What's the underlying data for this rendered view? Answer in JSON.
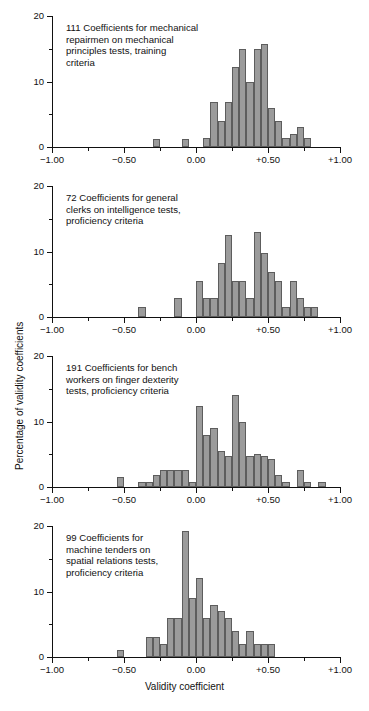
{
  "figure": {
    "axis_label_y": "Percentage of validity coefficients",
    "axis_label_x": "Validity coefficient",
    "x_ticks": [
      "−1.00",
      "−0.50",
      "0.00",
      "+0.50",
      "+1.00"
    ],
    "x_tick_values": [
      -1.0,
      -0.5,
      0.0,
      0.5,
      1.0
    ],
    "y_ticks": [
      "0",
      "10",
      "20"
    ],
    "y_tick_values": [
      0,
      10,
      20
    ],
    "bar_color": "#9b9b9b",
    "bar_edge_color": "#5d5d5d",
    "axis_color": "#111111"
  },
  "chart_data": [
    {
      "type": "bar",
      "title": "111 Coefficients for mechanical repairmen on mechanical principles tests, training criteria",
      "caption_lines": "111 Coefficients for mechanical\nrepairmen on mechanical\nprinciples tests, training\ncriteria",
      "n": 111,
      "xlabel": "Validity coefficient",
      "ylabel": "Percentage of validity coefficients",
      "xlim": [
        -1.0,
        1.0
      ],
      "ylim": [
        0,
        20
      ],
      "bin_width": 0.05,
      "grid": false,
      "bins": [
        -0.3,
        -0.1,
        0.05,
        0.1,
        0.15,
        0.2,
        0.25,
        0.3,
        0.35,
        0.4,
        0.45,
        0.5,
        0.55,
        0.6,
        0.65,
        0.7,
        0.75
      ],
      "values": [
        1.2,
        1.2,
        1.3,
        6.8,
        4.0,
        6.8,
        12.2,
        15.0,
        10.0,
        15.0,
        15.8,
        6.0,
        4.0,
        1.3,
        2.0,
        3.0,
        1.3
      ]
    },
    {
      "type": "bar",
      "title": "72 Coefficients for general clerks on intelligence tests, proficiency criteria",
      "caption_lines": "72 Coefficients for general\nclerks on intelligence tests,\nproficiency criteria",
      "n": 72,
      "xlabel": "Validity coefficient",
      "ylabel": "Percentage of validity coefficients",
      "xlim": [
        -1.0,
        1.0
      ],
      "ylim": [
        0,
        20
      ],
      "bin_width": 0.05,
      "grid": false,
      "bins": [
        -0.4,
        -0.15,
        0.0,
        0.05,
        0.1,
        0.15,
        0.2,
        0.25,
        0.3,
        0.35,
        0.4,
        0.45,
        0.5,
        0.55,
        0.6,
        0.65,
        0.7,
        0.75,
        0.8
      ],
      "values": [
        1.6,
        2.9,
        5.5,
        2.9,
        2.9,
        8.3,
        12.5,
        5.5,
        5.5,
        2.9,
        13.0,
        9.7,
        6.9,
        5.5,
        1.6,
        5.5,
        2.9,
        1.6,
        1.6
      ]
    },
    {
      "type": "bar",
      "title": "191 Coefficients for bench workers on finger dexterity tests, proficiency criteria",
      "caption_lines": "191 Coefficients for bench\nworkers on finger dexterity\ntests, proficiency criteria",
      "n": 191,
      "xlabel": "Validity coefficient",
      "ylabel": "Percentage of validity coefficients",
      "xlim": [
        -1.0,
        1.0
      ],
      "ylim": [
        0,
        20
      ],
      "bin_width": 0.05,
      "grid": false,
      "bins": [
        -0.55,
        -0.4,
        -0.35,
        -0.3,
        -0.25,
        -0.2,
        -0.15,
        -0.1,
        -0.05,
        0.0,
        0.05,
        0.1,
        0.15,
        0.2,
        0.25,
        0.3,
        0.35,
        0.4,
        0.45,
        0.5,
        0.55,
        0.6,
        0.7,
        0.75,
        0.85
      ],
      "values": [
        1.6,
        0.8,
        0.8,
        1.8,
        2.6,
        2.6,
        2.6,
        2.6,
        0.8,
        12.3,
        7.9,
        9.0,
        5.5,
        4.7,
        14.0,
        10.0,
        4.7,
        5.0,
        4.7,
        4.3,
        1.8,
        0.8,
        2.6,
        0.8,
        0.8
      ]
    },
    {
      "type": "bar",
      "title": "99 Coefficients for machine tenders on spatial relations tests, proficiency criteria",
      "caption_lines": "99 Coefficients for\nmachine tenders on\nspatial relations tests,\nproficiency criteria",
      "n": 99,
      "xlabel": "Validity coefficient",
      "ylabel": "Percentage of validity coefficients",
      "xlim": [
        -1.0,
        1.0
      ],
      "ylim": [
        0,
        20
      ],
      "bin_width": 0.05,
      "grid": false,
      "bins": [
        -0.55,
        -0.35,
        -0.3,
        -0.25,
        -0.2,
        -0.15,
        -0.1,
        -0.05,
        0.0,
        0.05,
        0.1,
        0.15,
        0.2,
        0.25,
        0.3,
        0.35,
        0.4,
        0.45,
        0.5
      ],
      "values": [
        1.0,
        3.0,
        3.0,
        2.0,
        6.0,
        6.0,
        19.2,
        9.0,
        12.0,
        6.0,
        8.0,
        7.0,
        6.0,
        4.0,
        2.0,
        4.0,
        2.0,
        2.0,
        2.0
      ]
    }
  ]
}
